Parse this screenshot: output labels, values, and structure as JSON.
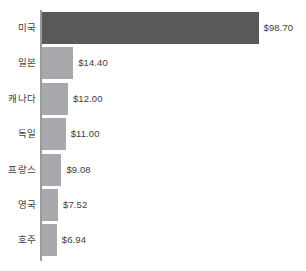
{
  "chart_data": {
    "type": "bar",
    "orientation": "horizontal",
    "title": "",
    "subtitle": "",
    "xlabel": "",
    "ylabel": "",
    "grid": false,
    "legend": null,
    "axis_range": [
      0,
      98.7
    ],
    "value_prefix": "$",
    "categories": [
      "미국",
      "일본",
      "캐나다",
      "독일",
      "프랑스",
      "영국",
      "호주"
    ],
    "values": [
      98.7,
      14.4,
      12.0,
      11.0,
      9.08,
      7.52,
      6.94
    ],
    "value_labels": [
      "$98.70",
      "$14.40",
      "$12.00",
      "$11.00",
      "$9.08",
      "$7.52",
      "$6.94"
    ],
    "bars": [
      {
        "category": "미국",
        "value": 98.7,
        "label": "$98.70",
        "highlight": true
      },
      {
        "category": "일본",
        "value": 14.4,
        "label": "$14.40",
        "highlight": false
      },
      {
        "category": "캐나다",
        "value": 12.0,
        "label": "$12.00",
        "highlight": false
      },
      {
        "category": "독일",
        "value": 11.0,
        "label": "$11.00",
        "highlight": false
      },
      {
        "category": "프랑스",
        "value": 9.08,
        "label": "$9.08",
        "highlight": false
      },
      {
        "category": "영국",
        "value": 7.52,
        "label": "$7.52",
        "highlight": false
      },
      {
        "category": "호주",
        "value": 6.94,
        "label": "$6.94",
        "highlight": false
      }
    ],
    "colors": {
      "bar_default": "#a7a9ac",
      "bar_highlight": "#58595b",
      "axis": "#9a9a9a",
      "text": "#414042",
      "background": "#ffffff"
    }
  }
}
